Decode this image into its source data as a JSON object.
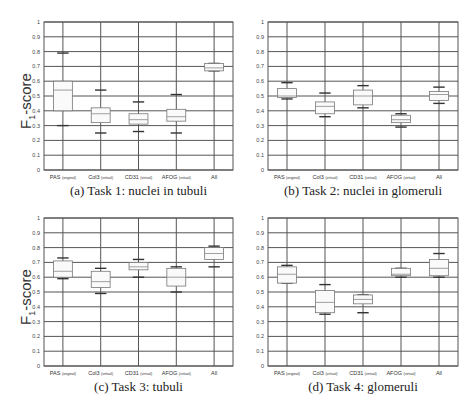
{
  "figure": {
    "ylabel_main": "F",
    "ylabel_sub": "1",
    "ylabel_rest": "-score",
    "yticks": [
      "0",
      "0.1",
      "0.2",
      "0.3",
      "0.4",
      "0.5",
      "0.6",
      "0.7",
      "0.8",
      "0.9",
      "1"
    ],
    "categories": [
      {
        "main": "PAS",
        "note": "(original)"
      },
      {
        "main": "Col3",
        "note": "(virtual)"
      },
      {
        "main": "CD31",
        "note": "(virtual)"
      },
      {
        "main": "AFOG",
        "note": "(virtual)"
      },
      {
        "main": "All",
        "note": ""
      }
    ]
  },
  "captions": {
    "a": "(a) Task 1: nuclei in tubuli",
    "b": "(b) Task 2: nuclei in glomeruli",
    "c": "(c) Task 3: tubuli",
    "d": "(d) Task 4: glomeruli"
  },
  "chart_data": [
    {
      "type": "box",
      "title": "(a) Task 1: nuclei in tubuli",
      "xlabel": "",
      "ylabel": "F1-score",
      "ylim": [
        0,
        1
      ],
      "grid": true,
      "categories": [
        "PAS (original)",
        "Col3 (virtual)",
        "CD31 (virtual)",
        "AFOG (virtual)",
        "All"
      ],
      "boxes": [
        {
          "whisker_low": 0.3,
          "q1": 0.4,
          "median": 0.54,
          "q3": 0.6,
          "whisker_high": 0.79
        },
        {
          "whisker_low": 0.25,
          "q1": 0.32,
          "median": 0.38,
          "q3": 0.42,
          "whisker_high": 0.54
        },
        {
          "whisker_low": 0.26,
          "q1": 0.31,
          "median": 0.34,
          "q3": 0.38,
          "whisker_high": 0.46
        },
        {
          "whisker_low": 0.25,
          "q1": 0.33,
          "median": 0.36,
          "q3": 0.41,
          "whisker_high": 0.51
        },
        {
          "whisker_low": 0.67,
          "q1": 0.67,
          "median": 0.69,
          "q3": 0.72,
          "whisker_high": 0.72
        }
      ]
    },
    {
      "type": "box",
      "title": "(b) Task 2: nuclei in glomeruli",
      "xlabel": "",
      "ylabel": "",
      "ylim": [
        0,
        1
      ],
      "grid": true,
      "categories": [
        "PAS (original)",
        "Col3 (virtual)",
        "CD31 (virtual)",
        "AFOG (virtual)",
        "All"
      ],
      "boxes": [
        {
          "whisker_low": 0.48,
          "q1": 0.49,
          "median": 0.5,
          "q3": 0.55,
          "whisker_high": 0.59
        },
        {
          "whisker_low": 0.36,
          "q1": 0.38,
          "median": 0.43,
          "q3": 0.46,
          "whisker_high": 0.52
        },
        {
          "whisker_low": 0.42,
          "q1": 0.44,
          "median": 0.5,
          "q3": 0.54,
          "whisker_high": 0.57
        },
        {
          "whisker_low": 0.29,
          "q1": 0.32,
          "median": 0.34,
          "q3": 0.37,
          "whisker_high": 0.38
        },
        {
          "whisker_low": 0.45,
          "q1": 0.47,
          "median": 0.51,
          "q3": 0.53,
          "whisker_high": 0.56
        }
      ]
    },
    {
      "type": "box",
      "title": "(c) Task 3: tubuli",
      "xlabel": "",
      "ylabel": "F1-score",
      "ylim": [
        0,
        1
      ],
      "grid": true,
      "categories": [
        "PAS (original)",
        "Col3 (virtual)",
        "CD31 (virtual)",
        "AFOG (virtual)",
        "All"
      ],
      "boxes": [
        {
          "whisker_low": 0.59,
          "q1": 0.6,
          "median": 0.64,
          "q3": 0.71,
          "whisker_high": 0.73
        },
        {
          "whisker_low": 0.49,
          "q1": 0.53,
          "median": 0.57,
          "q3": 0.64,
          "whisker_high": 0.66
        },
        {
          "whisker_low": 0.6,
          "q1": 0.65,
          "median": 0.67,
          "q3": 0.7,
          "whisker_high": 0.72
        },
        {
          "whisker_low": 0.5,
          "q1": 0.54,
          "median": 0.6,
          "q3": 0.66,
          "whisker_high": 0.67
        },
        {
          "whisker_low": 0.67,
          "q1": 0.72,
          "median": 0.76,
          "q3": 0.8,
          "whisker_high": 0.81
        }
      ]
    },
    {
      "type": "box",
      "title": "(d) Task 4: glomeruli",
      "xlabel": "",
      "ylabel": "",
      "ylim": [
        0,
        1
      ],
      "grid": true,
      "categories": [
        "PAS (original)",
        "Col3 (virtual)",
        "CD31 (virtual)",
        "AFOG (virtual)",
        "All"
      ],
      "boxes": [
        {
          "whisker_low": 0.56,
          "q1": 0.56,
          "median": 0.62,
          "q3": 0.67,
          "whisker_high": 0.68
        },
        {
          "whisker_low": 0.35,
          "q1": 0.36,
          "median": 0.43,
          "q3": 0.51,
          "whisker_high": 0.55
        },
        {
          "whisker_low": 0.36,
          "q1": 0.42,
          "median": 0.45,
          "q3": 0.48,
          "whisker_high": 0.48
        },
        {
          "whisker_low": 0.6,
          "q1": 0.61,
          "median": 0.62,
          "q3": 0.66,
          "whisker_high": 0.66
        },
        {
          "whisker_low": 0.6,
          "q1": 0.61,
          "median": 0.66,
          "q3": 0.72,
          "whisker_high": 0.76
        }
      ]
    }
  ]
}
